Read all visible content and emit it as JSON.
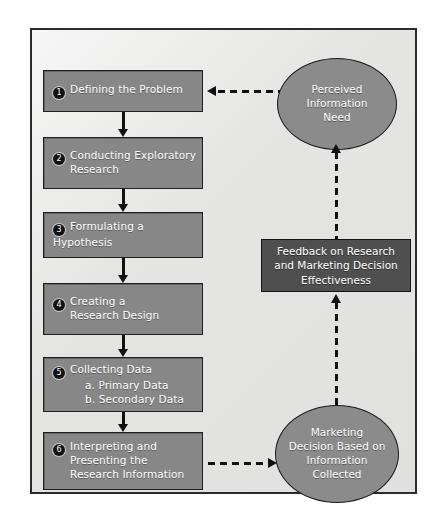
{
  "diagram": {
    "colors": {
      "page_background": "#ffffff",
      "frame_background": "#ececeb",
      "frame_border": "#2b2b2b",
      "process_box_fill": "#878787",
      "feedback_box_fill": "#4f4f4f",
      "ellipse_fill": "#8b8b8b",
      "node_border": "#1a1a1a",
      "text": "#ffffff",
      "connector": "#111111"
    },
    "steps": [
      {
        "number": "1",
        "label": "Defining the Problem",
        "sub": []
      },
      {
        "number": "2",
        "label": "Conducting Exploratory\nResearch",
        "sub": []
      },
      {
        "number": "3",
        "label": "Formulating a Hypothesis",
        "sub": []
      },
      {
        "number": "4",
        "label": "Creating a\nResearch Design",
        "sub": []
      },
      {
        "number": "5",
        "label": "Collecting Data",
        "sub": [
          "a.  Primary Data",
          "b.  Secondary Data"
        ]
      },
      {
        "number": "6",
        "label": "Interpreting and\nPresenting the\nResearch Information",
        "sub": []
      }
    ],
    "nodes": {
      "perceived_need": "Perceived\nInformation\nNeed",
      "feedback": "Feedback on Research\nand Marketing Decision\nEffectiveness",
      "marketing_decision": "Marketing\nDecision Based on\nInformation\nCollected"
    },
    "connectors": [
      {
        "name": "step1-to-step2",
        "style": "solid",
        "direction": "down"
      },
      {
        "name": "step2-to-step3",
        "style": "solid",
        "direction": "down"
      },
      {
        "name": "step3-to-step4",
        "style": "solid",
        "direction": "down"
      },
      {
        "name": "step4-to-step5",
        "style": "solid",
        "direction": "down"
      },
      {
        "name": "step5-to-step6",
        "style": "solid",
        "direction": "down"
      },
      {
        "name": "step6-to-marketing-decision",
        "style": "dashed",
        "direction": "right"
      },
      {
        "name": "marketing-decision-to-feedback",
        "style": "dashed",
        "direction": "up"
      },
      {
        "name": "feedback-to-perceived-need",
        "style": "dashed",
        "direction": "up"
      },
      {
        "name": "perceived-need-to-step1",
        "style": "dashed",
        "direction": "left"
      }
    ]
  }
}
